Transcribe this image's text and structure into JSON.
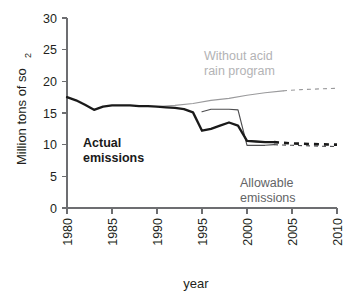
{
  "chart_data": {
    "type": "line",
    "title": "",
    "xlabel": "year",
    "ylabel": "Million tons of so",
    "ylabel_subscript": "2",
    "xlim": [
      1980,
      2010
    ],
    "ylim": [
      0,
      30
    ],
    "grid": false,
    "legend_position": "inline-annotations",
    "x_ticks": [
      "1980",
      "1985",
      "1990",
      "1995",
      "2000",
      "2005",
      "2010"
    ],
    "y_ticks": [
      "0",
      "5",
      "10",
      "15",
      "20",
      "25",
      "30"
    ],
    "series": [
      {
        "name": "Actual emissions",
        "style": "solid-bold",
        "color": "#1a1a1a",
        "x": [
          1980,
          1981,
          1982,
          1983,
          1984,
          1985,
          1986,
          1987,
          1988,
          1989,
          1990,
          1991,
          1992,
          1993,
          1994,
          1995,
          1996,
          1997,
          1998,
          1999,
          2000,
          2001,
          2002,
          2003
        ],
        "y": [
          17.5,
          17.0,
          16.3,
          15.5,
          16.0,
          16.2,
          16.2,
          16.2,
          16.1,
          16.1,
          16.0,
          15.9,
          15.8,
          15.6,
          15.1,
          12.2,
          12.5,
          13.0,
          13.5,
          13.0,
          10.6,
          10.5,
          10.4,
          10.4
        ]
      },
      {
        "name": "Actual emissions projected",
        "style": "dashed-bold",
        "color": "#1a1a1a",
        "x": [
          2003,
          2005,
          2007,
          2010
        ],
        "y": [
          10.4,
          10.2,
          10.1,
          10.0
        ]
      },
      {
        "name": "Allowable emissions",
        "style": "solid-thin",
        "color": "#4d4d4f",
        "x": [
          1995,
          1996,
          1997,
          1998,
          1999,
          2000,
          2001,
          2002,
          2003
        ],
        "y": [
          15.2,
          15.6,
          15.6,
          15.6,
          15.5,
          9.9,
          9.9,
          9.9,
          10.0
        ]
      },
      {
        "name": "Allowable emissions projected",
        "style": "dashed-thin",
        "color": "#4d4d4f",
        "x": [
          2003,
          2005,
          2007,
          2010
        ],
        "y": [
          10.0,
          9.9,
          9.8,
          9.7
        ]
      },
      {
        "name": "Without acid rain program",
        "style": "solid-thin-gray",
        "color": "#9a9a9c",
        "x": [
          1990,
          1992,
          1994,
          1996,
          1998,
          2000,
          2002,
          2004
        ],
        "y": [
          16.0,
          16.2,
          16.5,
          17.0,
          17.3,
          17.8,
          18.2,
          18.5
        ]
      },
      {
        "name": "Without acid rain program projected",
        "style": "dashed-thin-gray",
        "color": "#9a9a9c",
        "x": [
          2004,
          2006,
          2008,
          2010
        ],
        "y": [
          18.5,
          18.7,
          18.8,
          18.9
        ]
      }
    ],
    "annotations": [
      {
        "id": "actual",
        "text": "Actual\nemissions",
        "color": "#1a1a1a",
        "bold": true
      },
      {
        "id": "allowable",
        "text": "Allowable\nemissions",
        "color": "#636466",
        "bold": false
      },
      {
        "id": "without",
        "text": "Without acid\nrain program",
        "color": "#b3b3b5",
        "bold": false
      }
    ]
  }
}
